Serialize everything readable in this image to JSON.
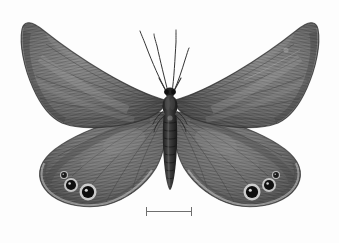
{
  "image": {
    "kind": "specimen-photograph",
    "subject": "butterfly",
    "view": "dorsal, wings spread",
    "color_mode": "grayscale",
    "background_color": "#fdfdfd",
    "width": 339,
    "height": 243
  },
  "palette": {
    "background": "#fdfdfd",
    "wing_base": "#7a7a7a",
    "wing_dark": "#4a4a4a",
    "wing_darkest": "#2e2e2e",
    "wing_light_band": "#9d9d9d",
    "wing_highlight": "#b4b4b4",
    "body_dark": "#2b2b2b",
    "antenna": "#3a3a3a",
    "eyespot_center": "#141414",
    "eyespot_ring": "#cfcfcf",
    "eyespot_pupil": "#e8e8e8",
    "margin_line": "#d8d8d8",
    "scale_bar": "#6e6e6e"
  },
  "specimen": {
    "body": {
      "head_center": [
        170,
        92
      ],
      "thorax_center": [
        170,
        106
      ],
      "abdomen_top": [
        170,
        118
      ],
      "abdomen_bottom": [
        170,
        190
      ],
      "abdomen_segments": 9
    },
    "antennae": [
      {
        "side": "left",
        "base": [
          166,
          90
        ],
        "tip": [
          141,
          32
        ],
        "clubbed": true
      },
      {
        "side": "right",
        "base": [
          174,
          90
        ],
        "tip": [
          176,
          30
        ],
        "clubbed": true
      },
      {
        "side": "left-inner",
        "base": [
          167,
          92
        ],
        "tip": [
          155,
          36
        ],
        "clubbed": true
      },
      {
        "side": "right-inner",
        "base": [
          173,
          92
        ],
        "tip": [
          184,
          56
        ],
        "clubbed": true
      }
    ],
    "wings": [
      {
        "name": "left-forewing",
        "side": "left",
        "position": "fore",
        "apex": [
          24,
          22
        ],
        "tornus": [
          60,
          120
        ]
      },
      {
        "name": "right-forewing",
        "side": "right",
        "position": "fore",
        "apex": [
          316,
          22
        ],
        "tornus": [
          280,
          120
        ]
      },
      {
        "name": "left-hindwing",
        "side": "left",
        "position": "hind",
        "outer": [
          42,
          150
        ],
        "tornus": [
          105,
          205
        ]
      },
      {
        "name": "right-hindwing",
        "side": "right",
        "position": "hind",
        "outer": [
          298,
          150
        ],
        "tornus": [
          235,
          205
        ]
      }
    ],
    "eyespots": [
      {
        "wing": "left-hindwing",
        "index": 1,
        "cx": 64,
        "cy": 175,
        "r": 4.0,
        "label": "small-anterior"
      },
      {
        "wing": "left-hindwing",
        "index": 2,
        "cx": 71,
        "cy": 185,
        "r": 7.0,
        "label": "medial"
      },
      {
        "wing": "left-hindwing",
        "index": 3,
        "cx": 88,
        "cy": 192,
        "r": 8.5,
        "label": "large-posterior"
      },
      {
        "wing": "right-hindwing",
        "index": 1,
        "cx": 276,
        "cy": 175,
        "r": 4.0,
        "label": "small-anterior"
      },
      {
        "wing": "right-hindwing",
        "index": 2,
        "cx": 269,
        "cy": 185,
        "r": 7.0,
        "label": "medial"
      },
      {
        "wing": "right-hindwing",
        "index": 3,
        "cx": 252,
        "cy": 192,
        "r": 8.5,
        "label": "large-posterior"
      }
    ]
  },
  "scale_bar": {
    "caption": "",
    "x_start": 146,
    "x_end": 192,
    "y": 211,
    "length_px": 46,
    "color": "#6e6e6e",
    "has_end_ticks": true
  }
}
